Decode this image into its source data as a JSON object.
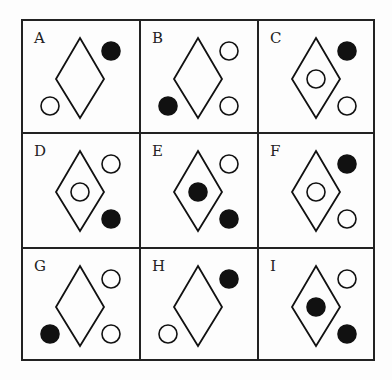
{
  "puzzle": {
    "cells": [
      {
        "label": "A",
        "inner": null,
        "top_right": "filled",
        "bottom_right": null,
        "bottom_left": "open"
      },
      {
        "label": "B",
        "inner": null,
        "top_right": "open",
        "bottom_right": "open",
        "bottom_left": "filled"
      },
      {
        "label": "C",
        "inner": "open",
        "top_right": "filled",
        "bottom_right": "open",
        "bottom_left": null
      },
      {
        "label": "D",
        "inner": "open",
        "top_right": "open",
        "bottom_right": "filled",
        "bottom_left": null
      },
      {
        "label": "E",
        "inner": "filled",
        "top_right": "open",
        "bottom_right": "filled",
        "bottom_left": null
      },
      {
        "label": "F",
        "inner": "open",
        "top_right": "filled",
        "bottom_right": "open",
        "bottom_left": null
      },
      {
        "label": "G",
        "inner": null,
        "top_right": "open",
        "bottom_right": "open",
        "bottom_left": "filled"
      },
      {
        "label": "H",
        "inner": null,
        "top_right": "filled",
        "bottom_right": null,
        "bottom_left": "open"
      },
      {
        "label": "I",
        "inner": "filled",
        "top_right": "open",
        "bottom_right": "filled",
        "bottom_left": null
      }
    ]
  },
  "colors": {
    "stroke": "#111111",
    "fill": "#111111",
    "background": "#fdfdfd"
  }
}
